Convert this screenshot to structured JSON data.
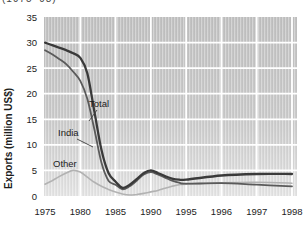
{
  "page": {
    "caption_clipped": "(1975–98)"
  },
  "chart_data": {
    "type": "line",
    "title": "",
    "xlabel": "",
    "ylabel": "Exports (million US$)",
    "ylim": [
      0,
      35
    ],
    "grid": true,
    "gridline_color": "#ffffff",
    "plot_bg_top_color": "#c2c2c2",
    "plot_bg_bottom_color": "#e6e6e6",
    "axis_text_color": "#1c1c1c",
    "y_ticks": [
      0,
      5,
      10,
      15,
      20,
      25,
      30,
      35
    ],
    "x_tick_labels": [
      "1975",
      "1980",
      "1985",
      "1990",
      "1995",
      "1996",
      "1997",
      "1998"
    ],
    "x_tick_years": [
      1975,
      1980,
      1985,
      1990,
      1995,
      1996,
      1997,
      1998
    ],
    "axis_note": "x axis spacing is uniform per tick label (5-year steps to 1995, then 1-year steps)",
    "legend_position": "inline-labels",
    "years": [
      1975,
      1976,
      1977,
      1978,
      1979,
      1980,
      1981,
      1982,
      1983,
      1984,
      1985,
      1986,
      1987,
      1988,
      1989,
      1990,
      1991,
      1992,
      1993,
      1994,
      1995,
      1996,
      1997,
      1998
    ],
    "series": [
      {
        "name": "Total",
        "color": "#3a3a3a",
        "width": 2.3,
        "values": [
          30.0,
          29.5,
          29.0,
          28.5,
          27.9,
          27.0,
          24.0,
          16.5,
          9.0,
          4.5,
          2.8,
          1.6,
          2.2,
          3.3,
          4.5,
          5.0,
          4.5,
          3.9,
          3.4,
          3.2,
          3.2,
          4.0,
          4.3,
          4.3
        ]
      },
      {
        "name": "India",
        "color": "#5a5a5a",
        "width": 1.8,
        "values": [
          28.5,
          27.7,
          26.8,
          25.8,
          24.3,
          22.5,
          19.0,
          13.0,
          6.5,
          3.0,
          2.2,
          1.3,
          1.9,
          3.0,
          4.2,
          4.7,
          4.2,
          3.6,
          3.0,
          2.6,
          2.4,
          2.5,
          2.2,
          1.9
        ]
      },
      {
        "name": "Other",
        "color": "#b2b2b2",
        "width": 1.6,
        "values": [
          2.3,
          3.0,
          3.8,
          4.5,
          5.0,
          4.7,
          3.7,
          2.7,
          1.9,
          1.3,
          0.8,
          0.4,
          0.2,
          0.3,
          0.5,
          0.8,
          1.1,
          1.5,
          1.9,
          2.2,
          2.3,
          2.6,
          2.7,
          2.5
        ]
      }
    ],
    "annotations": [
      {
        "text": "Total",
        "x": 89,
        "y": 107,
        "color": "#2a2a2a",
        "leader": [
          [
            97,
            110
          ],
          [
            89,
            121
          ]
        ]
      },
      {
        "text": "India",
        "x": 58,
        "y": 136,
        "color": "#2a2a2a",
        "leader": [
          [
            77,
            139
          ],
          [
            93,
            147
          ]
        ]
      },
      {
        "text": "Other",
        "x": 53,
        "y": 167,
        "color": "#4d4d4d",
        "leader": null
      }
    ]
  }
}
